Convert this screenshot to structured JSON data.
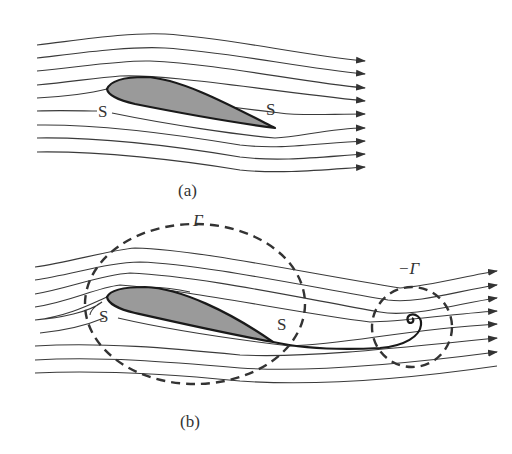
{
  "figure": {
    "panels": [
      {
        "id": "a",
        "caption": "(a)",
        "labels": {
          "leading_stagnation": "S",
          "trailing_stagnation": "S"
        },
        "streamline_count": 9,
        "description": "Flow around airfoil with stagnation point on upper surface near trailing edge"
      },
      {
        "id": "b",
        "caption": "(b)",
        "labels": {
          "leading_stagnation": "S",
          "trailing_stagnation": "S",
          "bound_circulation": "Γ",
          "starting_vortex_circulation": "−Γ"
        },
        "streamline_count": 9,
        "description": "Kutta condition: bound vortex circulation Γ around airfoil and shed starting vortex −Γ"
      }
    ]
  }
}
